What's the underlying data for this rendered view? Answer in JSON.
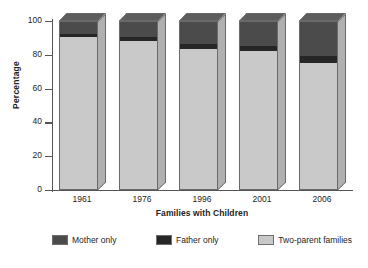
{
  "chart_data": {
    "type": "bar",
    "subtype": "stacked-column-3d",
    "title": "",
    "xlabel": "Families with Children",
    "ylabel": "Percentage",
    "categories": [
      "1961",
      "1976",
      "1996",
      "2001",
      "2006"
    ],
    "ylim": [
      0,
      100
    ],
    "yticks": [
      0,
      20,
      40,
      60,
      80,
      100
    ],
    "ytick_labels": [
      "0",
      "20",
      "40",
      "60",
      "80",
      "100"
    ],
    "grid": false,
    "legend_position": "bottom",
    "series": [
      {
        "name": "Two-parent families",
        "color": "#c9c9c9",
        "values": [
          91,
          89,
          84,
          83,
          76
        ]
      },
      {
        "name": "Father only",
        "color": "#262626",
        "values": [
          2,
          2,
          3,
          3,
          4
        ]
      },
      {
        "name": "Mother only",
        "color": "#4b4b4b",
        "values": [
          7,
          9,
          13,
          14,
          20
        ]
      }
    ],
    "stack_order_bottom_to_top": [
      "Two-parent families",
      "Father only",
      "Mother only"
    ]
  },
  "axes": {
    "y_title": "Percentage",
    "x_title": "Families with Children",
    "y_tick_labels": [
      "100",
      "80",
      "60",
      "40",
      "20",
      "0"
    ],
    "x_tick_labels": [
      "1961",
      "1976",
      "1996",
      "2001",
      "2006"
    ]
  },
  "legend": {
    "items": [
      {
        "label": "Mother only",
        "color": "#4b4b4b"
      },
      {
        "label": "Father only",
        "color": "#262626"
      },
      {
        "label": "Two-parent families",
        "color": "#c9c9c9"
      }
    ]
  }
}
